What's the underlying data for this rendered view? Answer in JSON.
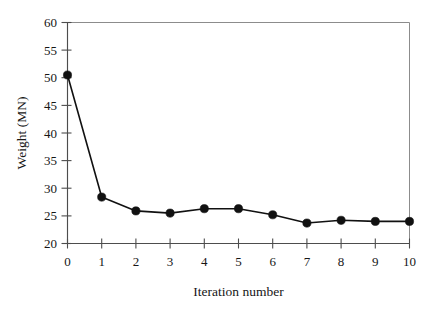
{
  "chart_data": {
    "type": "line",
    "title": "",
    "xlabel": "Iteration number",
    "ylabel": "Weight (MN)",
    "x": [
      0,
      1,
      2,
      3,
      4,
      5,
      6,
      7,
      8,
      9,
      10
    ],
    "values": [
      50.5,
      28.4,
      25.9,
      25.5,
      26.3,
      26.3,
      25.2,
      23.7,
      24.2,
      24.0,
      24.0
    ],
    "series": [
      {
        "name": "Weight",
        "values": [
          50.5,
          28.4,
          25.9,
          25.5,
          26.3,
          26.3,
          25.2,
          23.7,
          24.2,
          24.0,
          24.0
        ]
      }
    ],
    "xlim": [
      0,
      10
    ],
    "ylim": [
      20,
      60
    ],
    "xticks": [
      "0",
      "1",
      "2",
      "3",
      "4",
      "5",
      "6",
      "7",
      "8",
      "9",
      "10"
    ],
    "yticks": [
      "20",
      "25",
      "30",
      "35",
      "40",
      "45",
      "50",
      "55",
      "60"
    ],
    "xtick_values": [
      0,
      1,
      2,
      3,
      4,
      5,
      6,
      7,
      8,
      9,
      10
    ],
    "ytick_values": [
      20,
      25,
      30,
      35,
      40,
      45,
      50,
      55,
      60
    ],
    "grid": false,
    "legend": null,
    "legend_position": "none",
    "marker": "filled-circle",
    "line_color": "#111111",
    "marker_color": "#111111",
    "background_color": "#ffffff",
    "axis_color": "#4d4d4d"
  }
}
